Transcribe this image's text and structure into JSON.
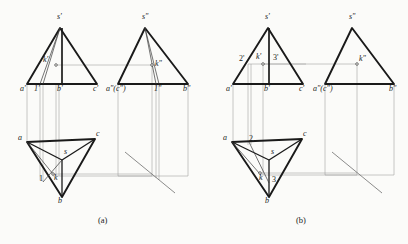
{
  "figure": {
    "captions": [
      {
        "id": "cap-a",
        "text": "(a)",
        "x": 98,
        "y": 216
      },
      {
        "id": "cap-b",
        "text": "(b)",
        "x": 296,
        "y": 216
      }
    ],
    "colors": {
      "outline": "#1a1a1a",
      "thin": "#3a3a3a",
      "projection": "#9a9a9a",
      "background": "#fbfbf9",
      "label": "#1a1a1a"
    },
    "stroke_widths": {
      "solid_heavy": 1.9,
      "solid_medium": 1.0,
      "thin": 0.6,
      "projection": 0.55
    }
  },
  "panel_a": {
    "name": "(a)",
    "front_view": {
      "name": "front-view-a",
      "apex": {
        "label": "s'",
        "x": 60,
        "y": 28
      },
      "base_left": {
        "label": "a'",
        "x": 27,
        "y": 84
      },
      "base_mid": {
        "label": "b'",
        "x": 62,
        "y": 84
      },
      "base_right": {
        "label": "c'",
        "x": 97,
        "y": 84
      },
      "aux_point": {
        "label": "1'",
        "x": 40,
        "y": 84
      },
      "k_point": {
        "label": "k'",
        "x": 56,
        "y": 65
      },
      "labels": [
        {
          "text": "s'",
          "x": 57,
          "y": 17
        },
        {
          "text": "k'",
          "x": 44,
          "y": 60
        },
        {
          "text": "a'",
          "x": 22,
          "y": 87
        },
        {
          "text": "1'",
          "x": 35,
          "y": 87
        },
        {
          "text": "b'",
          "x": 58,
          "y": 87
        },
        {
          "text": "c'",
          "x": 94,
          "y": 87
        }
      ]
    },
    "side_view": {
      "name": "side-view-a",
      "apex": {
        "label": "s\"",
        "x": 145,
        "y": 28
      },
      "base_left": {
        "label": "a\"(c\")",
        "x": 118,
        "y": 84
      },
      "base_right": {
        "label": "b\"",
        "x": 188,
        "y": 84
      },
      "aux_point": {
        "label": "1\"",
        "x": 159,
        "y": 84
      },
      "k_point": {
        "label": "k\"",
        "x": 152,
        "y": 65
      },
      "labels": [
        {
          "text": "s\"",
          "x": 142,
          "y": 17
        },
        {
          "text": "k\"",
          "x": 156,
          "y": 63
        },
        {
          "text": "a\"(c\")",
          "x": 108,
          "y": 87
        },
        {
          "text": "1\"",
          "x": 155,
          "y": 87
        },
        {
          "text": "b\"",
          "x": 184,
          "y": 87
        }
      ]
    },
    "top_view": {
      "name": "top-view-a",
      "a": {
        "label": "a",
        "x": 27,
        "y": 142
      },
      "b": {
        "label": "b",
        "x": 62,
        "y": 197
      },
      "c": {
        "label": "c",
        "x": 95,
        "y": 139
      },
      "s": {
        "label": "s",
        "x": 62,
        "y": 160
      },
      "k": {
        "label": "k",
        "x": 53,
        "y": 174
      },
      "one": {
        "label": "1",
        "x": 44,
        "y": 178
      },
      "labels": [
        {
          "text": "a",
          "x": 20,
          "y": 139
        },
        {
          "text": "c",
          "x": 96,
          "y": 134
        },
        {
          "text": "s",
          "x": 64,
          "y": 152
        },
        {
          "text": "k",
          "x": 54,
          "y": 176
        },
        {
          "text": "1",
          "x": 40,
          "y": 178
        },
        {
          "text": "b",
          "x": 59,
          "y": 201
        }
      ]
    },
    "miter_line": {
      "name": "miter-line-a",
      "x1": 125,
      "y1": 152,
      "x2": 175,
      "y2": 193
    }
  },
  "panel_b": {
    "name": "(b)",
    "front_view": {
      "name": "front-view-b",
      "apex": {
        "label": "s'",
        "x": 268,
        "y": 28
      },
      "base_left": {
        "label": "a'",
        "x": 233,
        "y": 84
      },
      "base_mid": {
        "label": "b'",
        "x": 269,
        "y": 84
      },
      "base_right": {
        "label": "c'",
        "x": 303,
        "y": 84
      },
      "two": {
        "label": "2'",
        "x": 248,
        "y": 64
      },
      "three": {
        "label": "3'",
        "x": 280,
        "y": 64
      },
      "k_point": {
        "label": "k'",
        "x": 263,
        "y": 64
      },
      "labels": [
        {
          "text": "s'",
          "x": 265,
          "y": 17
        },
        {
          "text": "2'",
          "x": 240,
          "y": 60
        },
        {
          "text": "k'",
          "x": 257,
          "y": 58
        },
        {
          "text": "3'",
          "x": 274,
          "y": 59
        },
        {
          "text": "a'",
          "x": 228,
          "y": 87
        },
        {
          "text": "b'",
          "x": 265,
          "y": 87
        },
        {
          "text": "c'",
          "x": 300,
          "y": 87
        }
      ]
    },
    "side_view": {
      "name": "side-view-b",
      "apex": {
        "label": "s\"",
        "x": 352,
        "y": 28
      },
      "base_left": {
        "label": "a\"(c\")",
        "x": 325,
        "y": 84
      },
      "base_right": {
        "label": "b\"",
        "x": 394,
        "y": 84
      },
      "k_point": {
        "label": "k\"",
        "x": 357,
        "y": 64
      },
      "labels": [
        {
          "text": "s\"",
          "x": 349,
          "y": 17
        },
        {
          "text": "k\"",
          "x": 360,
          "y": 60
        },
        {
          "text": "a\"(c\")",
          "x": 315,
          "y": 87
        },
        {
          "text": "b\"",
          "x": 390,
          "y": 87
        }
      ]
    },
    "top_view": {
      "name": "top-view-b",
      "a": {
        "label": "a",
        "x": 232,
        "y": 142
      },
      "b": {
        "label": "b",
        "x": 269,
        "y": 197
      },
      "c": {
        "label": "c",
        "x": 302,
        "y": 139
      },
      "s": {
        "label": "s",
        "x": 269,
        "y": 160
      },
      "k": {
        "label": "k",
        "x": 260,
        "y": 173
      },
      "two": {
        "label": "2",
        "x": 249,
        "y": 142
      },
      "three": {
        "label": "3",
        "x": 272,
        "y": 178
      },
      "labels": [
        {
          "text": "a",
          "x": 225,
          "y": 139
        },
        {
          "text": "2",
          "x": 249,
          "y": 139
        },
        {
          "text": "c",
          "x": 303,
          "y": 134
        },
        {
          "text": "s",
          "x": 271,
          "y": 152
        },
        {
          "text": "k",
          "x": 259,
          "y": 177
        },
        {
          "text": "3",
          "x": 273,
          "y": 180
        },
        {
          "text": "b",
          "x": 266,
          "y": 201
        }
      ]
    },
    "miter_line": {
      "name": "miter-line-b",
      "x1": 332,
      "y1": 152,
      "x2": 382,
      "y2": 193
    }
  }
}
